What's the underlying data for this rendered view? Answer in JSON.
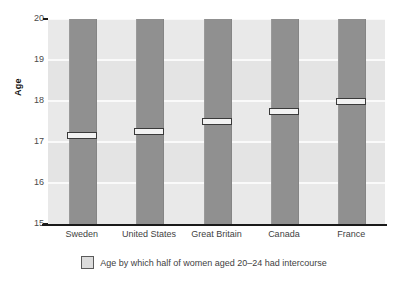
{
  "chart_data": {
    "type": "bar",
    "title": "",
    "subtitle": "",
    "xlabel": "",
    "ylabel": "Age",
    "ylim": [
      15,
      20
    ],
    "yticks": [
      15,
      16,
      17,
      18,
      19,
      20
    ],
    "ytick_labels": [
      "15",
      "16",
      "17",
      "18",
      "19",
      "20"
    ],
    "grid": true,
    "legend_position": "bottom-center",
    "categories": [
      "Sweden",
      "United States",
      "Great Britain",
      "Canada",
      "France"
    ],
    "values": [
      17.15,
      17.25,
      17.5,
      17.75,
      18.0
    ],
    "series": [
      {
        "name": "Age by which half of women aged 20–24 had intercourse",
        "values": [
          17.15,
          17.25,
          17.5,
          17.75,
          18.0
        ]
      }
    ],
    "bar_top_value": 20,
    "bar_color": "#909090",
    "marker_fill": "#f2f2f2",
    "marker_border": "#3a3a3a",
    "plot_background": "#e4e4e4",
    "gridline_color": "#fafafa",
    "axis_color": "#1a1a1a"
  },
  "legend": {
    "items": [
      {
        "label": "Age by which half of women aged 20–24 had intercourse",
        "swatch_color": "#dcdcdc"
      }
    ]
  },
  "axis": {
    "y_title": "Age"
  }
}
